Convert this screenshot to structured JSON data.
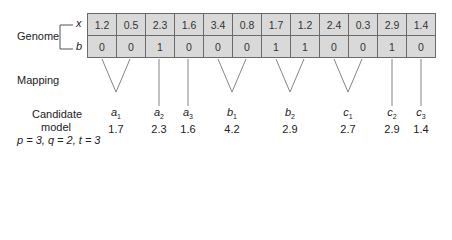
{
  "genome": {
    "label": "Genome",
    "row_labels": [
      "x",
      "b"
    ],
    "x": [
      "1.2",
      "0.5",
      "2.3",
      "1.6",
      "3.4",
      "0.8",
      "1.7",
      "1.2",
      "2.4",
      "0.3",
      "2.9",
      "1.4"
    ],
    "b": [
      "0",
      "0",
      "1",
      "0",
      "0",
      "0",
      "1",
      "1",
      "0",
      "0",
      "1",
      "0"
    ]
  },
  "mapping": {
    "label": "Mapping"
  },
  "candidate_model": {
    "label_line1": "Candidate",
    "label_line2": "model",
    "params": "p = 3, q = 2, t = 3",
    "genes": [
      {
        "name": "a",
        "sub": "1",
        "value": "1.7"
      },
      {
        "name": "a",
        "sub": "2",
        "value": "2.3"
      },
      {
        "name": "a",
        "sub": "3",
        "value": "1.6"
      },
      {
        "name": "b",
        "sub": "1",
        "value": "4.2"
      },
      {
        "name": "b",
        "sub": "2",
        "value": "2.9"
      },
      {
        "name": "c",
        "sub": "1",
        "value": "2.7"
      },
      {
        "name": "c",
        "sub": "2",
        "value": "2.9"
      },
      {
        "name": "c",
        "sub": "3",
        "value": "1.4"
      }
    ]
  },
  "colors": {
    "cell_bg": "#d9d9d9",
    "border": "#6a6a6a",
    "line": "#777777"
  }
}
